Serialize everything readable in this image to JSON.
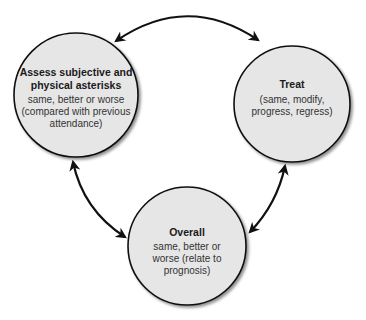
{
  "diagram": {
    "type": "cycle",
    "colors": {
      "circle_fill": "#e6e6e6",
      "circle_stroke": "#111111",
      "arrow": "#111111",
      "background": "#ffffff"
    },
    "nodes": [
      {
        "id": "assess",
        "title": "Assess subjective and physical asterisks",
        "body": "same, better or worse (compared with previous attendance)"
      },
      {
        "id": "treat",
        "title": "Treat",
        "body": "(same, modify, progress, regress)"
      },
      {
        "id": "overall",
        "title": "Overall",
        "body": "same, better or worse (relate to prognosis)"
      }
    ],
    "edges": [
      {
        "from": "assess",
        "to": "treat",
        "bidirectional": true
      },
      {
        "from": "treat",
        "to": "overall",
        "bidirectional": true
      },
      {
        "from": "overall",
        "to": "assess",
        "bidirectional": true
      }
    ]
  }
}
